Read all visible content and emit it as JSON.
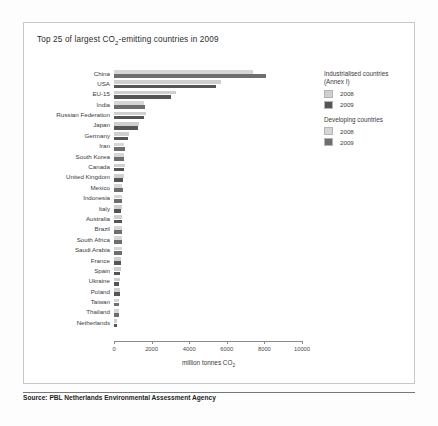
{
  "figure": {
    "title": "Top 25 of largest CO2-emitting countries in 2009",
    "title_prefix": "Top 25 of largest CO",
    "title_subscript": "2",
    "title_suffix": "-emitting countries in 2009",
    "source": "Source: PBL Netherlands Environmental Assessment Agency"
  },
  "axis": {
    "label_prefix": "million tonnes CO",
    "label_subscript": "2",
    "ticks": [
      "0",
      "2000",
      "4000",
      "6000",
      "8000",
      "10000"
    ]
  },
  "legend": {
    "groups": [
      {
        "heading_line1": "Industrialised countries",
        "heading_line2": "(Annex I)",
        "items": [
          {
            "label": "2008",
            "color": "#cfcfcf"
          },
          {
            "label": "2009",
            "color": "#555555"
          }
        ]
      },
      {
        "heading_line1": "Developing countries",
        "heading_line2": "",
        "items": [
          {
            "label": "2008",
            "color": "#d6d6d6"
          },
          {
            "label": "2009",
            "color": "#6e6e6e"
          }
        ]
      }
    ]
  },
  "colors": {
    "industrialised_2008": "#cfcfcf",
    "industrialised_2009": "#555555",
    "developing_2008": "#d6d6d6",
    "developing_2009": "#6e6e6e",
    "axis": "#8a8a8a",
    "text": "#3a3a3a",
    "panel_border": "#c8c8c8"
  },
  "chart_data": {
    "type": "bar",
    "orientation": "horizontal",
    "title": "Top 25 of largest CO2-emitting countries in 2009",
    "xlabel": "million tonnes CO2",
    "ylabel": "",
    "xlim": [
      0,
      10000
    ],
    "xticks": [
      0,
      2000,
      4000,
      6000,
      8000,
      10000
    ],
    "grid": false,
    "legend_position": "right",
    "categories": [
      "China",
      "USA",
      "EU-15",
      "India",
      "Russian Federation",
      "Japan",
      "Germany",
      "Iran",
      "South Korea",
      "Canada",
      "United Kingdom",
      "Mexico",
      "Indonesia",
      "Italy",
      "Australia",
      "Brazil",
      "South Africa",
      "Saudi Arabia",
      "France",
      "Spain",
      "Ukraine",
      "Poland",
      "Taiwan",
      "Thailand",
      "Netherlands"
    ],
    "group": [
      "developing",
      "industrialised",
      "industrialised",
      "developing",
      "industrialised",
      "industrialised",
      "industrialised",
      "developing",
      "developing",
      "industrialised",
      "industrialised",
      "developing",
      "developing",
      "industrialised",
      "industrialised",
      "developing",
      "developing",
      "developing",
      "industrialised",
      "industrialised",
      "industrialised",
      "industrialised",
      "developing",
      "developing",
      "industrialised"
    ],
    "series": [
      {
        "name": "2008",
        "values": [
          7400,
          5700,
          3300,
          1600,
          1700,
          1350,
          800,
          540,
          520,
          560,
          520,
          450,
          420,
          430,
          400,
          400,
          430,
          420,
          390,
          360,
          320,
          320,
          270,
          250,
          180
        ]
      },
      {
        "name": "2009",
        "values": [
          8100,
          5400,
          3050,
          1650,
          1600,
          1250,
          770,
          560,
          530,
          540,
          480,
          460,
          450,
          390,
          410,
          410,
          420,
          440,
          380,
          330,
          280,
          310,
          260,
          260,
          180
        ]
      }
    ]
  }
}
